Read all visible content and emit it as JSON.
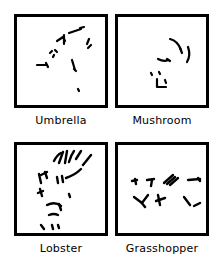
{
  "figure": {
    "background_color": "#ffffff",
    "ink_color": "#000000",
    "frame_border_px": 3,
    "panel_size_px": 88,
    "columns": 2,
    "rows": 2
  },
  "panels": [
    {
      "id": "umbrella",
      "label": "Umbrella",
      "position": "top-left",
      "fragment_count": 12,
      "fragments": [
        "M 52 16 L 64 12",
        "M 63 11 L 67 10",
        "M 40 24 L 46 20 L 48 24",
        "M 47 18 L 47 27",
        "M 72 22 L 70 27",
        "M 74 28 L 71 31",
        "M 33 36 L 35 34",
        "M 38 33 L 40 35",
        "M 36 40 L 37 38",
        "M 20 48 L 30 48",
        "M 29 46 L 31 50",
        "M 55 43 L 58 53",
        "M 57 52 L 59 54",
        "M 61 72 L 62 74"
      ]
    },
    {
      "id": "mushroom",
      "label": "Mushroom",
      "position": "top-right",
      "fragment_count": 7,
      "fragments": [
        "M 52 22 Q 60 24 63 33",
        "M 62 31 L 64 36",
        "M 70 30 Q 73 38 69 45",
        "M 40 42 Q 46 45 50 43",
        "M 49 42 L 52 44",
        "M 33 56 L 34 58",
        "M 41 55 L 42 57",
        "M 39 62 L 39 70 L 48 70",
        "M 47 63 L 48 66"
      ]
    },
    {
      "id": "lobster",
      "label": "Lobster",
      "position": "bottom-left",
      "fragment_count": 18,
      "fragments": [
        "M 37 16 Q 40 10 44 8",
        "M 42 18 L 46 7",
        "M 48 18 L 50 6",
        "M 52 17 Q 54 10 57 6",
        "M 59 14 L 64 6",
        "M 66 20 L 74 10",
        "M 22 29 L 24 38",
        "M 24 30 L 30 27",
        "M 28 27 L 30 33",
        "M 23 44 L 25 51",
        "M 21 48 L 26 46",
        "M 40 32 L 41 38",
        "M 45 31 L 46 37",
        "M 49 33 Q 58 30 64 24",
        "M 52 49 L 53 52",
        "M 30 60 Q 38 56 44 61",
        "M 42 59 L 44 65",
        "M 32 70 Q 37 68 41 70",
        "M 24 80 L 27 84",
        "M 35 80 L 36 84",
        "M 41 80 L 42 83"
      ]
    },
    {
      "id": "grasshopper",
      "label": "Grasshopper",
      "position": "bottom-right",
      "fragment_count": 14,
      "fragments": [
        "M 14 36 L 19 35",
        "M 17 34 L 18 39",
        "M 29 35 L 36 34",
        "M 34 35 L 33 41",
        "M 46 38 L 55 30",
        "M 49 39 L 57 32",
        "M 52 40 L 60 33",
        "M 70 35 L 82 34",
        "M 80 33 L 82 36",
        "M 16 52 L 24 58 L 30 50",
        "M 23 57 L 27 62",
        "M 40 50 L 42 60",
        "M 38 56 L 47 53",
        "M 66 52 L 72 60",
        "M 76 61 L 82 58"
      ]
    }
  ]
}
